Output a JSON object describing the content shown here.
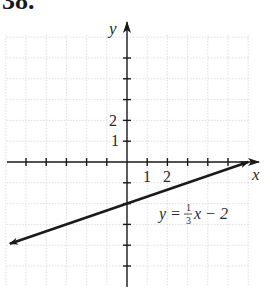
{
  "problem": {
    "number": "38."
  },
  "chart_data": {
    "type": "line",
    "title": "",
    "xlabel": "x",
    "ylabel": "y",
    "equation": "y = (1/3)x − 2",
    "equation_parts": {
      "lhs": "y =",
      "num": "1",
      "den": "3",
      "rhs": "x − 2"
    },
    "xlim": [
      -6,
      6
    ],
    "ylim": [
      -6,
      6.5
    ],
    "grid": true,
    "x_tick_labels": [
      {
        "value": 1,
        "label": "1"
      },
      {
        "value": 2,
        "label": "2"
      }
    ],
    "y_tick_labels": [
      {
        "value": 1,
        "label": "1"
      },
      {
        "value": 2,
        "label": "2"
      }
    ],
    "series": [
      {
        "name": "y = (1/3)x − 2",
        "slope": 0.3333,
        "intercept": -2,
        "x": [
          -5.8,
          0,
          6
        ],
        "y": [
          -3.93,
          -2,
          0
        ],
        "arrows": "both"
      }
    ]
  }
}
